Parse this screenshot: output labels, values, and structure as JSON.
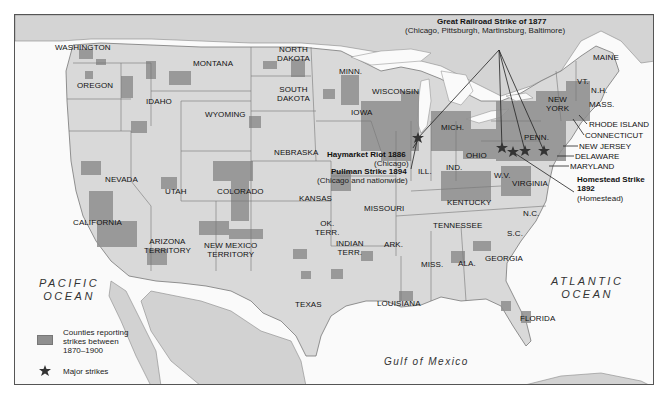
{
  "map": {
    "states": [
      {
        "name": "WASHINGTON",
        "x": 68,
        "y": 46
      },
      {
        "name": "MONTANA",
        "x": 175,
        "y": 62
      },
      {
        "name": "OREGON",
        "x": 60,
        "y": 84
      },
      {
        "name": "IDAHO",
        "x": 130,
        "y": 100
      },
      {
        "name": "WYOMING",
        "x": 194,
        "y": 113
      },
      {
        "name": "NORTH\nDAKOTA",
        "x": 276,
        "y": 53
      },
      {
        "name": "SOUTH\nDAKOTA",
        "x": 276,
        "y": 92
      },
      {
        "name": "MINN.",
        "x": 332,
        "y": 70
      },
      {
        "name": "WISCONSIN",
        "x": 376,
        "y": 90
      },
      {
        "name": "IOWA",
        "x": 350,
        "y": 112
      },
      {
        "name": "NEBRASKA",
        "x": 286,
        "y": 138
      },
      {
        "name": "MICH.",
        "x": 441,
        "y": 124
      },
      {
        "name": "NEVADA",
        "x": 110,
        "y": 163
      },
      {
        "name": "UTAH",
        "x": 170,
        "y": 177
      },
      {
        "name": "COLORADO",
        "x": 219,
        "y": 183
      },
      {
        "name": "KANSAS",
        "x": 271,
        "y": 194
      },
      {
        "name": "MISSOURI",
        "x": 366,
        "y": 203
      },
      {
        "name": "ILL.",
        "x": 419,
        "y": 167
      },
      {
        "name": "IND.",
        "x": 446,
        "y": 163
      },
      {
        "name": "OHIO",
        "x": 475,
        "y": 150
      },
      {
        "name": "W.V.",
        "x": 498,
        "y": 172
      },
      {
        "name": "VIRGINIA",
        "x": 530,
        "y": 180
      },
      {
        "name": "KENTUCKY",
        "x": 456,
        "y": 196
      },
      {
        "name": "TENNESSEE",
        "x": 442,
        "y": 220
      },
      {
        "name": "N.C.",
        "x": 523,
        "y": 207
      },
      {
        "name": "S.C.",
        "x": 506,
        "y": 229
      },
      {
        "name": "GEORGIA",
        "x": 489,
        "y": 254
      },
      {
        "name": "ALA.",
        "x": 449,
        "y": 258
      },
      {
        "name": "MISS.",
        "x": 414,
        "y": 259
      },
      {
        "name": "ARK.",
        "x": 377,
        "y": 240
      },
      {
        "name": "OK.\nTERR.",
        "x": 316,
        "y": 222
      },
      {
        "name": "INDIAN\nTERR.",
        "x": 350,
        "y": 245
      },
      {
        "name": "CALIFORNIA",
        "x": 96,
        "y": 217
      },
      {
        "name": "ARIZONA\nTERRITORY",
        "x": 166,
        "y": 240
      },
      {
        "name": "NEW MEXICO\nTERRITORY",
        "x": 229,
        "y": 245
      },
      {
        "name": "TEXAS",
        "x": 303,
        "y": 288
      },
      {
        "name": "LOUISIANA",
        "x": 389,
        "y": 299
      },
      {
        "name": "FLORIDA",
        "x": 523,
        "y": 314
      },
      {
        "name": "PENN.",
        "x": 521,
        "y": 131
      },
      {
        "name": "NEW\nYORK",
        "x": 545,
        "y": 99
      },
      {
        "name": "MAINE",
        "x": 590,
        "y": 56
      },
      {
        "name": "VT.",
        "x": 570,
        "y": 79
      },
      {
        "name": "N.H.",
        "x": 584,
        "y": 87
      },
      {
        "name": "MASS.",
        "x": 585,
        "y": 101
      }
    ],
    "callouts": [
      {
        "name": "RHODE ISLAND",
        "x": 588,
        "y": 120
      },
      {
        "name": "CONNECTICUT",
        "x": 584,
        "y": 131
      },
      {
        "name": "NEW JERSEY",
        "x": 578,
        "y": 142
      },
      {
        "name": "DELAWARE",
        "x": 574,
        "y": 152
      },
      {
        "name": "MARYLAND",
        "x": 569,
        "y": 162
      }
    ],
    "oceans": {
      "pacific": "PACIFIC\nOCEAN",
      "atlantic": "ATLANTIC\nOCEAN",
      "gulf": "Gulf of Mexico"
    },
    "strikes": [
      {
        "title": "Great Railroad Strike of 1877",
        "subtitle": "(Chicago, Pittsburgh, Martinsburg, Baltimore)"
      },
      {
        "title": "Haymarket Riot 1886",
        "subtitle": "(Chicago)"
      },
      {
        "title": "Pullman Strike 1894",
        "subtitle": "(Chicago and nationwide)"
      },
      {
        "title": "Homestead Strike\n1892",
        "subtitle": "(Homestead)"
      }
    ],
    "strike_locations": [
      {
        "city": "Chicago",
        "x": 417,
        "y": 137
      },
      {
        "city": "Pittsburgh",
        "x": 501,
        "y": 147
      },
      {
        "city": "Homestead",
        "x": 512,
        "y": 151
      },
      {
        "city": "Martinsburg",
        "x": 524,
        "y": 150
      },
      {
        "city": "Baltimore",
        "x": 543,
        "y": 150
      }
    ]
  },
  "legend": {
    "counties_label": "Counties reporting\nstrikes between\n1870–1900",
    "major_strikes_label": "Major strikes"
  },
  "colors": {
    "land": "#d9d9d9",
    "canada_mexico": "#cfcfcf",
    "water": "#fafafa",
    "strike_counties": "#8f8f8f",
    "border": "#555555"
  }
}
